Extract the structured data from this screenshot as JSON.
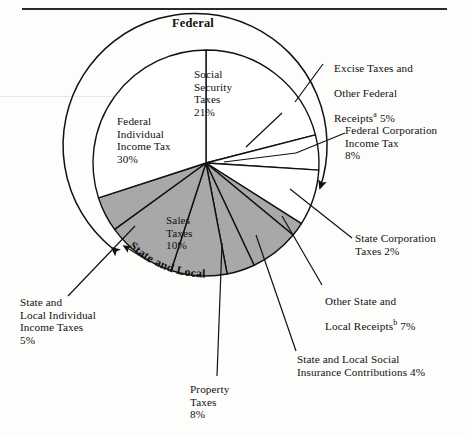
{
  "figure": {
    "group_labels": {
      "federal": "Federal",
      "state_local": "State and Local"
    }
  },
  "labels": {
    "social_security": "Social\nSecurity\nTaxes\n21%",
    "federal_individual": "Federal\nIndividual\nIncome Tax\n30%",
    "excise_other_federal_line1": "Excise Taxes and",
    "excise_other_federal_line2": "Other Federal",
    "excise_other_federal_line3_pre": "Receipts",
    "excise_other_federal_sup": "a",
    "excise_other_federal_line3_post": " 5%",
    "federal_corporation": "Federal Corporation\nIncome Tax\n8%",
    "state_corporation": "State Corporation\nTaxes 2%",
    "other_state_local_line1": "Other State and",
    "other_state_local_line2_pre": "Local Receipts",
    "other_state_local_sup": "b",
    "other_state_local_line2_post": " 7%",
    "state_local_social_insurance": "State and Local Social\nInsurance Contributions 4%",
    "state_local_individual": "State and\nLocal Individual\nIncome Taxes\n5%",
    "property_taxes": "Property\nTaxes\n8%",
    "sales_taxes": "Sales\nTaxes\n10%"
  },
  "chart_data": {
    "type": "pie",
    "total_percent": 100,
    "grid": false,
    "legend": "none",
    "groups": [
      {
        "name": "Federal",
        "total_percent": 64,
        "fill": "#ffffff"
      },
      {
        "name": "State and Local",
        "total_percent": 36,
        "fill": "#a8a8a8"
      }
    ],
    "start_angle_deg": -90,
    "direction": "clockwise",
    "categories": [
      "Social Security Taxes",
      "Excise Taxes and Other Federal Receipts",
      "Federal Corporation Income Tax",
      "State Corporation Taxes",
      "Other State and Local Receipts",
      "State and Local Social Insurance Contributions",
      "Property Taxes",
      "Sales Taxes",
      "State and Local Individual Income Taxes",
      "Federal Individual Income Tax"
    ],
    "values": [
      21,
      5,
      8,
      2,
      7,
      4,
      8,
      10,
      5,
      30
    ],
    "slices": [
      {
        "label": "Social Security Taxes",
        "value": 21,
        "group": "Federal",
        "fill": "#ffffff"
      },
      {
        "label": "Excise Taxes and Other Federal Receipts",
        "value": 5,
        "group": "Federal",
        "fill": "#ffffff"
      },
      {
        "label": "Federal Corporation Income Tax",
        "value": 8,
        "group": "Federal",
        "fill": "#ffffff"
      },
      {
        "label": "State Corporation Taxes",
        "value": 2,
        "group": "State and Local",
        "fill": "#a8a8a8"
      },
      {
        "label": "Other State and Local Receipts",
        "value": 7,
        "group": "State and Local",
        "fill": "#a8a8a8"
      },
      {
        "label": "State and Local Social Insurance Contributions",
        "value": 4,
        "group": "State and Local",
        "fill": "#a8a8a8"
      },
      {
        "label": "Property Taxes",
        "value": 8,
        "group": "State and Local",
        "fill": "#a8a8a8"
      },
      {
        "label": "Sales Taxes",
        "value": 10,
        "group": "State and Local",
        "fill": "#a8a8a8"
      },
      {
        "label": "State and Local Individual Income Taxes",
        "value": 5,
        "group": "State and Local",
        "fill": "#a8a8a8"
      },
      {
        "label": "Federal Individual Income Tax",
        "value": 30,
        "group": "Federal",
        "fill": "#ffffff"
      }
    ],
    "footnotes": [
      "a",
      "b"
    ],
    "xlabel": "",
    "ylabel": ""
  },
  "colors": {
    "ink": "#111111",
    "state_local_fill": "#a8a8a8",
    "federal_fill": "#ffffff",
    "rule": "#2a2a2a"
  }
}
